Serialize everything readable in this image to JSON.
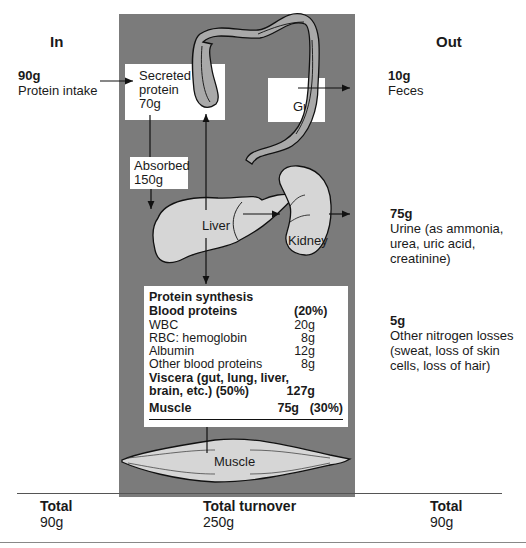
{
  "headers": {
    "in": "In",
    "out": "Out"
  },
  "intake": {
    "amount": "90g",
    "label": "Protein intake"
  },
  "secreted": {
    "line1": "Secreted",
    "line2": "protein",
    "amount": "70g"
  },
  "gut": {
    "label": "Gut"
  },
  "absorbed": {
    "label": "Absorbed",
    "amount": "150g"
  },
  "liver": {
    "label": "Liver"
  },
  "kidney": {
    "label": "Kidney"
  },
  "muscle_organ": {
    "label": "Muscle"
  },
  "outputs": [
    {
      "amount": "10g",
      "lines": [
        "Feces"
      ]
    },
    {
      "amount": "75g",
      "lines": [
        "Urine (as ammonia,",
        "urea, uric acid,",
        "creatinine)"
      ]
    },
    {
      "amount": "5g",
      "lines": [
        "Other nitrogen losses",
        "(sweat, loss of skin",
        "cells, loss of hair)"
      ]
    }
  ],
  "synthesis": {
    "title": "Protein synthesis",
    "blood_title": "Blood proteins",
    "blood_pct": "(20%)",
    "blood_items": [
      {
        "name": "WBC",
        "value": "20g"
      },
      {
        "name": "RBC: hemoglobin",
        "value": "8g"
      },
      {
        "name": "Albumin",
        "value": "12g"
      },
      {
        "name": "Other blood proteins",
        "value": "8g"
      }
    ],
    "viscera_line1": "Viscera (gut, lung, liver,",
    "viscera_line2": "brain, etc.) (50%)",
    "viscera_value": "127g",
    "muscle_name": "Muscle",
    "muscle_value": "75g",
    "muscle_pct": "(30%)"
  },
  "totals": {
    "in": {
      "label": "Total",
      "value": "90g"
    },
    "turnover": {
      "label": "Total turnover",
      "value": "250g"
    },
    "out": {
      "label": "Total",
      "value": "90g"
    }
  },
  "colors": {
    "panel": "#7b7b7b",
    "organ_fill": "#d6d6d6",
    "gut_fill": "#a9a9a9"
  }
}
